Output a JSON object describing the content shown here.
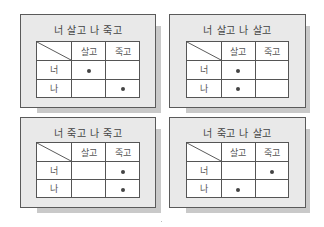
{
  "colors": {
    "panel_fill": "#e9e9e9",
    "panel_border": "#5a5a5a",
    "shadow": "#c9c9c9",
    "cell_fill": "#ffffff",
    "dot": "#444444"
  },
  "panels": [
    {
      "title": "너 살고 나 죽고",
      "col_headers": [
        "살고",
        "죽고"
      ],
      "rows": [
        {
          "label": "너",
          "marks": [
            true,
            false
          ]
        },
        {
          "label": "나",
          "marks": [
            false,
            true
          ]
        }
      ]
    },
    {
      "title": "너 살고 나 살고",
      "col_headers": [
        "살고",
        "죽고"
      ],
      "rows": [
        {
          "label": "너",
          "marks": [
            true,
            false
          ]
        },
        {
          "label": "나",
          "marks": [
            true,
            false
          ]
        }
      ]
    },
    {
      "title": "너 죽고 나 죽고",
      "col_headers": [
        "살고",
        "죽고"
      ],
      "rows": [
        {
          "label": "너",
          "marks": [
            false,
            true
          ]
        },
        {
          "label": "나",
          "marks": [
            false,
            true
          ]
        }
      ]
    },
    {
      "title": "너 죽고 나 살고",
      "col_headers": [
        "살고",
        "죽고"
      ],
      "rows": [
        {
          "label": "너",
          "marks": [
            false,
            true
          ]
        },
        {
          "label": "나",
          "marks": [
            true,
            false
          ]
        }
      ]
    }
  ]
}
